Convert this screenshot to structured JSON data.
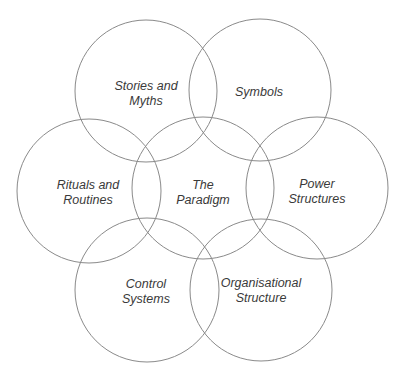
{
  "diagram": {
    "stroke_color": "#8a8a8a",
    "text_color": "#3a3a3a",
    "background": "#ffffff",
    "elements": [
      {
        "id": "stories-and-myths",
        "lines": [
          "Stories and",
          "Myths"
        ],
        "cx": 146,
        "cy": 91,
        "r": 71,
        "lx": 146,
        "ly": 94
      },
      {
        "id": "symbols",
        "lines": [
          "Symbols"
        ],
        "cx": 260,
        "cy": 90,
        "r": 71,
        "lx": 259,
        "ly": 92
      },
      {
        "id": "rituals-and-routines",
        "lines": [
          "Rituals and",
          "Routines"
        ],
        "cx": 89,
        "cy": 191,
        "r": 72,
        "lx": 88,
        "ly": 193
      },
      {
        "id": "the-paradigm",
        "lines": [
          "The",
          "Paradigm"
        ],
        "cx": 203,
        "cy": 188,
        "r": 71,
        "lx": 203,
        "ly": 193
      },
      {
        "id": "power-structures",
        "lines": [
          "Power",
          "Structures"
        ],
        "cx": 317,
        "cy": 188,
        "r": 71,
        "lx": 317,
        "ly": 192
      },
      {
        "id": "control-systems",
        "lines": [
          "Control",
          "Systems"
        ],
        "cx": 147,
        "cy": 290,
        "r": 72,
        "lx": 146,
        "ly": 292
      },
      {
        "id": "organisational-structure",
        "lines": [
          "Organisational",
          "Structure"
        ],
        "cx": 261,
        "cy": 290,
        "r": 71,
        "lx": 261,
        "ly": 291
      }
    ]
  }
}
